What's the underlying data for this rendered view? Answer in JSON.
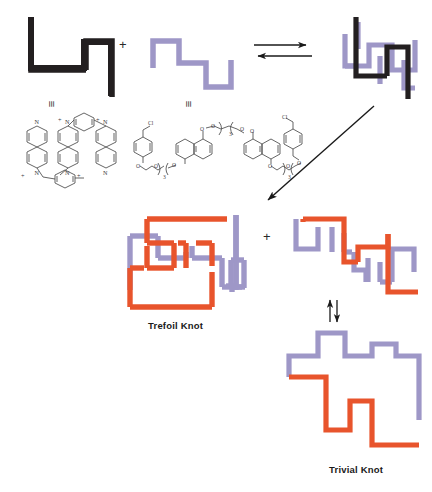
{
  "figure": {
    "type": "reaction-scheme"
  },
  "colors": {
    "black_macrocycle": "#231f20",
    "purple_thread": "#9e97c7",
    "orange_strand": "#e8542c",
    "chem_line": "#4a4a4a",
    "arrow": "#1a1a1a"
  },
  "labels": {
    "trefoil_knot": "Trefoil Knot",
    "trivial_knot": "Trivial Knot",
    "plus_top": "+",
    "plus_bottom": "+",
    "equiv_left": "≡",
    "equiv_right": "≡"
  },
  "icons": {
    "equilibrium_arrow": "equilibrium-arrow-icon",
    "diagonal_arrow": "diagonal-arrow-icon",
    "vertical_equilibrium_arrow": "vertical-equilibrium-arrow-icon"
  },
  "structures": {
    "tetracationic_cyclophane": {
      "name": "cyclobis(paraquat-p-phenylene)",
      "atom_labels": [
        "N",
        "N",
        "N",
        "N",
        "N",
        "N"
      ],
      "charges": [
        "+",
        "+",
        "+",
        "+"
      ]
    },
    "bisnaphtho_thread": {
      "name": "bis(naphtho) polyether dichloride",
      "atom_labels": [
        "Cl",
        "O",
        "O",
        "O",
        "O",
        "O",
        "O",
        "O",
        "Cl"
      ],
      "repeat_subscripts": [
        "3",
        "3",
        "3"
      ]
    }
  },
  "schematics": {
    "black_macrocycle_top_left": "black-zigzag-macrocycle",
    "purple_thread_top_mid": "purple-zigzag-thread",
    "complex_top_right": "black-purple-pseudorotaxane-complex",
    "trefoil": "orange-purple-trefoil-knot",
    "open_form": "orange-purple-open-chain",
    "trivial": "orange-purple-trivial-knot"
  }
}
